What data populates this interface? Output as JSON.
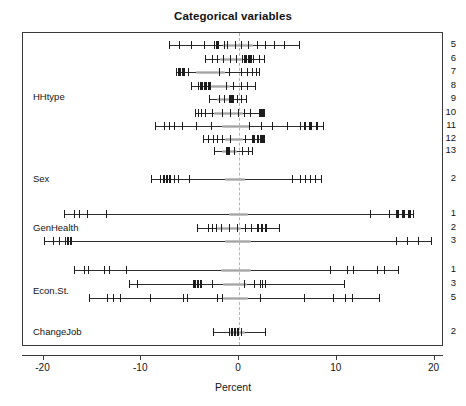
{
  "chart_data": {
    "type": "scatter",
    "title": "Categorical variables",
    "xlabel": "Percent",
    "ylabel": "",
    "xlim": [
      -22.1,
      21.0
    ],
    "xticks": [
      -20,
      -10,
      0,
      10,
      20
    ],
    "xticklabels": [
      "-20",
      "-10",
      "0",
      "10",
      "20"
    ],
    "grid": false,
    "legend": null,
    "zero_reference_line": 0,
    "groups": [
      {
        "name": "HHtype",
        "levels": [
          {
            "label": "5",
            "range": [
              -7.2,
              6.1
            ],
            "marks": [
              -7.2,
              -6.1,
              -4.9,
              -3.6,
              -2.6,
              -2.3,
              -1.5,
              -1.2,
              -0.4,
              0.2,
              0.9,
              1.8,
              2.7,
              3.6,
              4.6,
              6.1
            ],
            "heavy_marks": [
              -2.4,
              -2.2
            ],
            "grey_band": [
              -1.6,
              1.4
            ]
          },
          {
            "label": "6",
            "range": [
              -3.5,
              2.6
            ],
            "marks": [
              -3.5,
              -2.8,
              -2.2,
              -1.6,
              -0.9,
              -0.3,
              0.3,
              0.7,
              1.0,
              1.4,
              2.0,
              2.6
            ],
            "heavy_marks": [
              0.5,
              0.9,
              1.1
            ],
            "grey_band": [
              -1.9,
              0.3
            ]
          },
          {
            "label": "7",
            "range": [
              -6.4,
              2.0
            ],
            "marks": [
              -6.4,
              -6.0,
              -5.6,
              -5.2,
              -2.0,
              -1.0,
              0.2,
              0.8,
              1.3,
              1.7,
              2.0
            ],
            "heavy_marks": [
              -6.2,
              -5.8
            ],
            "grey_band": [
              -4.4,
              -1.4
            ]
          },
          {
            "label": "8",
            "range": [
              -4.9,
              1.6
            ],
            "marks": [
              -4.9,
              -4.2,
              -3.8,
              -3.4,
              -3.0,
              -1.3,
              -0.6,
              0.2,
              0.8,
              1.6
            ],
            "heavy_marks": [
              -4.0,
              -3.6,
              -3.2
            ],
            "grey_band": [
              -2.9,
              -0.9
            ]
          },
          {
            "label": "9",
            "range": [
              -3.1,
              0.7
            ],
            "marks": [
              -3.1,
              -2.0,
              -1.5,
              -1.0,
              -0.6,
              -0.2,
              0.2,
              0.7
            ],
            "heavy_marks": [
              -0.9,
              -0.7
            ],
            "grey_band": [
              -2.3,
              -0.6
            ]
          },
          {
            "label": "10",
            "range": [
              -4.5,
              2.6
            ],
            "marks": [
              -4.5,
              -4.2,
              -3.9,
              -3.5,
              -2.8,
              -1.7,
              -0.9,
              -0.1,
              0.5,
              1.1,
              2.0,
              2.4,
              2.6
            ],
            "heavy_marks": [
              2.0,
              2.3,
              2.5
            ],
            "grey_band": [
              -2.6,
              0.4
            ]
          },
          {
            "label": "11",
            "range": [
              -8.6,
              8.6
            ],
            "marks": [
              -8.6,
              -7.7,
              -7.2,
              -6.6,
              -5.8,
              -4.4,
              -2.9,
              1.0,
              2.2,
              3.4,
              4.9,
              6.2,
              7.2,
              8.0,
              8.6
            ],
            "heavy_marks": [
              6.6,
              7.3,
              7.9
            ],
            "grey_band": [
              -1.7,
              1.1
            ]
          },
          {
            "label": "12",
            "range": [
              -3.7,
              2.6
            ],
            "marks": [
              -3.7,
              -3.2,
              -2.7,
              -2.2,
              -1.7,
              -0.9,
              0.6,
              1.3,
              1.8,
              2.1,
              2.4,
              2.6
            ],
            "heavy_marks": [
              1.4,
              1.8,
              2.2,
              2.5
            ],
            "grey_band": [
              -1.4,
              0.4
            ]
          },
          {
            "label": "13",
            "range": [
              -2.6,
              1.3
            ],
            "marks": [
              -2.6,
              -1.0,
              -0.5,
              0.3,
              0.9,
              1.3
            ],
            "heavy_marks": [
              -1.3,
              -1.1
            ],
            "grey_band": [
              -1.7,
              -0.2
            ]
          }
        ]
      },
      {
        "name": "Sex",
        "levels": [
          {
            "label": "2",
            "range": [
              -9.0,
              8.4
            ],
            "marks": [
              -9.0,
              -8.1,
              -7.7,
              -7.4,
              -7.1,
              -6.7,
              -6.2,
              -5.1,
              5.4,
              6.2,
              6.8,
              7.3,
              7.8,
              8.4
            ],
            "heavy_marks": [
              -7.8,
              -7.5,
              -7.2
            ],
            "grey_band": [
              -1.4,
              0.6
            ]
          }
        ]
      },
      {
        "name": "GenHealth",
        "levels": [
          {
            "label": "1",
            "range": [
              -17.9,
              17.8
            ],
            "marks": [
              -17.9,
              -16.9,
              -16.4,
              -15.6,
              -13.6,
              13.4,
              15.3,
              16.1,
              16.7,
              17.3,
              17.8
            ],
            "heavy_marks": [
              16.2,
              16.8,
              17.4
            ],
            "grey_band": [
              -1.0,
              0.9
            ]
          },
          {
            "label": "2",
            "range": [
              -4.3,
              4.1
            ],
            "marks": [
              -4.3,
              -3.2,
              -2.8,
              -2.4,
              -1.8,
              -1.0,
              -0.2,
              0.6,
              1.2,
              1.8,
              2.3,
              2.8,
              4.1
            ],
            "heavy_marks": [
              1.8,
              2.3,
              2.7
            ],
            "grey_band": [
              -2.4,
              0.2
            ]
          },
          {
            "label": "3",
            "range": [
              -20.0,
              19.6
            ],
            "marks": [
              -20.0,
              -19.0,
              -18.4,
              -17.8,
              -17.2,
              16.1,
              17.2,
              18.3,
              19.6
            ],
            "heavy_marks": [
              -17.6,
              -17.3
            ],
            "grey_band": [
              -1.4,
              1.2
            ]
          }
        ]
      },
      {
        "name": "Econ.St.",
        "levels": [
          {
            "label": "1",
            "range": [
              -16.9,
              16.3
            ],
            "marks": [
              -16.9,
              -15.9,
              -15.4,
              -13.8,
              -13.3,
              -11.6,
              9.3,
              11.0,
              11.7,
              14.1,
              14.8,
              16.3
            ],
            "heavy_marks": [],
            "grey_band": [
              -1.8,
              1.2
            ]
          },
          {
            "label": "3",
            "range": [
              -11.3,
              10.7
            ],
            "marks": [
              -11.3,
              -10.4,
              -4.7,
              -4.3,
              -4.0,
              -2.8,
              0.5,
              1.5,
              2.1,
              2.4,
              2.7,
              10.7
            ],
            "heavy_marks": [
              -4.6,
              -4.3,
              -4.0
            ],
            "grey_band": [
              -1.6,
              0.8
            ]
          },
          {
            "label": "5",
            "range": [
              -15.3,
              14.3
            ],
            "marks": [
              -15.3,
              -13.5,
              -12.9,
              -12.2,
              -9.1,
              -5.7,
              -5.3,
              -2.3,
              -1.7,
              2.1,
              6.6,
              9.6,
              10.8,
              11.6,
              14.3
            ],
            "heavy_marks": [],
            "grey_band": [
              -1.6,
              0.9
            ]
          }
        ]
      },
      {
        "name": "ChangeJob",
        "levels": [
          {
            "label": "2",
            "range": [
              -2.7,
              2.7
            ],
            "marks": [
              -2.7,
              -1.0,
              -0.7,
              -0.4,
              -0.1,
              0.2,
              2.7
            ],
            "heavy_marks": [
              -0.8,
              -0.5,
              -0.2
            ],
            "grey_band": [
              -1.0,
              0.6
            ]
          }
        ]
      }
    ]
  }
}
